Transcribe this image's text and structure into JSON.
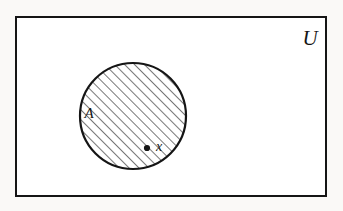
{
  "figure": {
    "kind": "venn-diagram",
    "background_color": "#faf9f7",
    "ink_color": "#151515"
  },
  "universe": {
    "label": "U",
    "shape": "rectangle",
    "x": 16,
    "y": 17,
    "width": 310,
    "height": 179,
    "stroke_width": 2.6,
    "label_x": 310,
    "label_y": 45
  },
  "set": {
    "label": "A",
    "shape": "circle",
    "center_x": 133,
    "center_y": 116,
    "radius": 53,
    "stroke_width": 2.2,
    "fill": "diagonal-hatch",
    "hatch_angle_deg": 45,
    "hatch_spacing": 7,
    "hatch_stroke_width": 1.2,
    "label_x": 89,
    "label_y": 118
  },
  "element": {
    "label": "x",
    "point_x": 147,
    "point_y": 148,
    "point_radius": 3.1,
    "label_x": 156,
    "label_y": 151
  },
  "a11y": {
    "figure_title": "Venn diagram: shaded circle A inside rectangle U containing point x"
  }
}
